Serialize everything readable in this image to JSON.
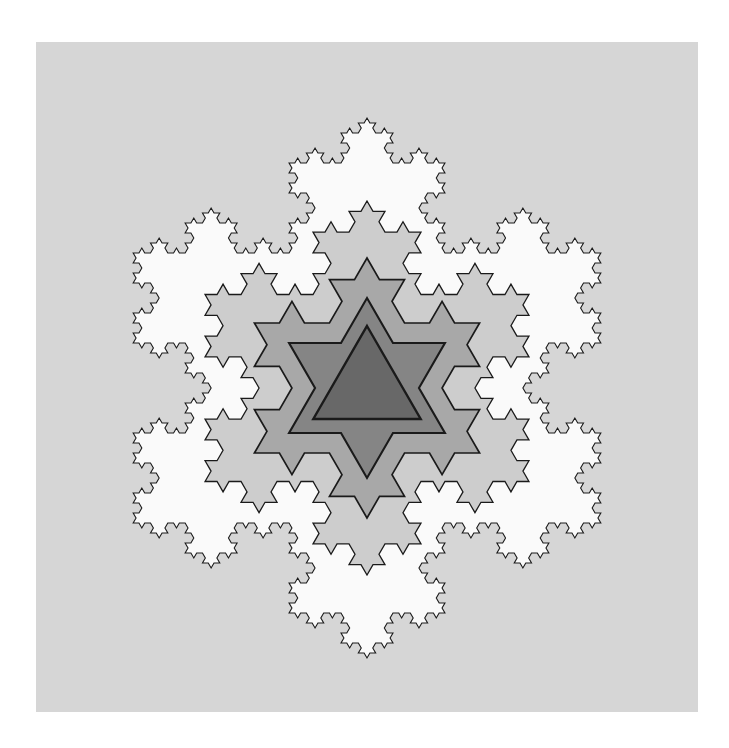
{
  "figure": {
    "kind": "fractal-illustration",
    "width": 729,
    "height": 748
  },
  "page": {
    "background_color": "#ffffff"
  },
  "canvas": {
    "name": "plot-canvas",
    "background_color": "#d6d6d6",
    "x": 36,
    "y": 42,
    "width": 662,
    "height": 670
  },
  "chart_data": {
    "type": "scatter",
    "xlabel": "",
    "ylabel": "",
    "center_x": 367,
    "center_y": 388,
    "rotation_deg": -90,
    "stroke_color": "#1a1a1a",
    "series": [
      {
        "name": "iteration-5",
        "iteration": 5,
        "order": 5,
        "radius": 270,
        "fill": "#fafafa",
        "stroke_width": 1.1,
        "segments": 3072,
        "label": "outermost snowflake"
      },
      {
        "name": "iteration-4",
        "iteration": 4,
        "order": 4,
        "radius": 187,
        "fill": "#cdcdcd",
        "stroke_width": 1.3,
        "segments": 768,
        "label": "fourth snowflake"
      },
      {
        "name": "iteration-3",
        "iteration": 3,
        "order": 3,
        "radius": 130,
        "fill": "#a8a8a8",
        "stroke_width": 1.7,
        "segments": 192,
        "label": "third snowflake"
      },
      {
        "name": "iteration-2",
        "iteration": 2,
        "order": 2,
        "radius": 90,
        "fill": "#858585",
        "stroke_width": 2.1,
        "segments": 48,
        "label": "second snowflake"
      },
      {
        "name": "iteration-1",
        "iteration": 1,
        "order": 1,
        "radius": 62,
        "fill": "#686868",
        "stroke_width": 2.4,
        "segments": 12,
        "label": "innermost star of david"
      }
    ]
  }
}
